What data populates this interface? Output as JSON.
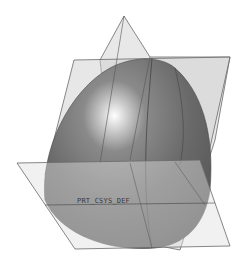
{
  "viewport": {
    "background": "#ffffff",
    "model": {
      "type": "dome-surface",
      "fill": "#6e6e6e",
      "highlight": "#f4f4f4"
    },
    "datum_planes": [
      {
        "name": "vertical-plane-front"
      },
      {
        "name": "vertical-plane-side"
      },
      {
        "name": "horizontal-plane"
      }
    ],
    "csys_label": "PRT_CSYS_DEF"
  }
}
